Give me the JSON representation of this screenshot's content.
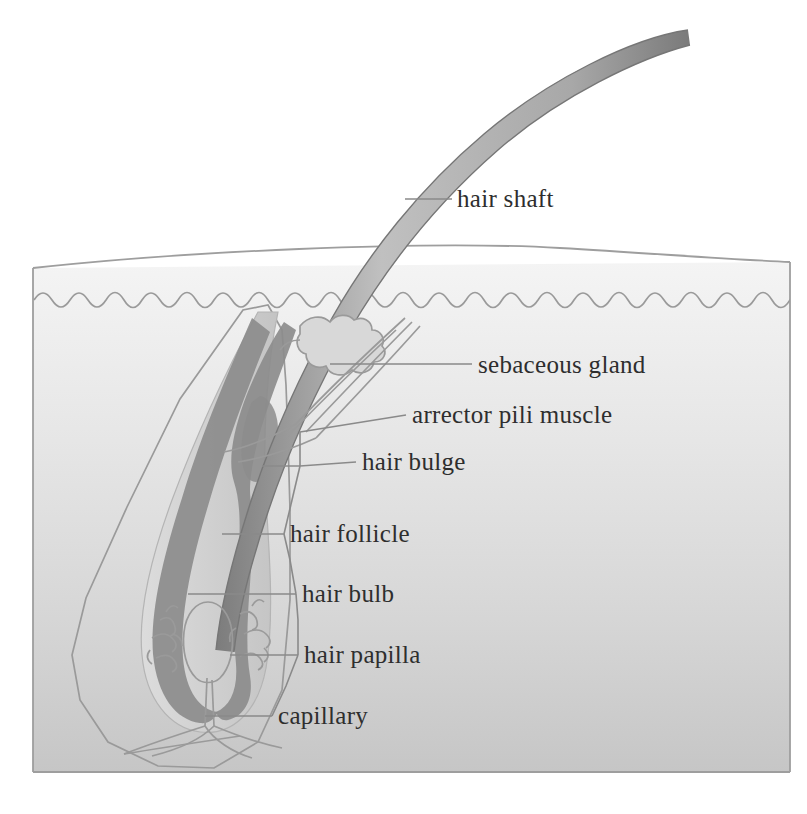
{
  "figure": {
    "type": "anatomical-diagram",
    "background_color": "#ffffff"
  },
  "colors": {
    "skin_top": "#f2f2f2",
    "skin_bottom": "#c9c9c9",
    "follicle_sheath": "#d3d3d3",
    "follicle_wall_dark": "#8f8f8f",
    "hair_shaft_fill": "#b9b9b9",
    "hair_shaft_edge": "#7e7e7e",
    "outline": "#9a9a9a",
    "leader_line": "#8a8a8a",
    "text": "#2e2e2e"
  },
  "labels": [
    {
      "id": "hair-shaft",
      "text": "hair shaft",
      "text_x": 457,
      "text_y": 207,
      "leader": "M 405 199 L 452 199"
    },
    {
      "id": "sebaceous-gland",
      "text": "sebaceous gland",
      "text_x": 478,
      "text_y": 373,
      "leader": "M 330 364 L 472 364"
    },
    {
      "id": "arrector-pili-muscle",
      "text": "arrector pili muscle",
      "text_x": 412,
      "text_y": 423,
      "leader": "M 360 415 L 406 415"
    },
    {
      "id": "hair-bulge",
      "text": "hair bulge",
      "text_x": 362,
      "text_y": 470,
      "leader": "M 288 462 L 356 462"
    },
    {
      "id": "hair-follicle",
      "text": "hair follicle",
      "text_x": 290,
      "text_y": 542,
      "leader": "M 222 534 L 284 534"
    },
    {
      "id": "hair-bulb",
      "text": "hair bulb",
      "text_x": 302,
      "text_y": 602,
      "leader": "M 188 594 L 296 594"
    },
    {
      "id": "hair-papilla",
      "text": "hair papilla",
      "text_x": 304,
      "text_y": 663,
      "leader": "M 230 655 L 298 655"
    },
    {
      "id": "capillary",
      "text": "capillary",
      "text_x": 278,
      "text_y": 724,
      "leader": "M 205 716 L 272 716"
    }
  ],
  "structures": {
    "skin_block_label": "skin block",
    "epidermis_label": "epidermis wavy boundary",
    "hair_shaft_label": "hair shaft",
    "sebaceous_gland_label": "sebaceous gland",
    "arrector_pili_label": "arrector pili muscle",
    "follicle_sheath_label": "follicle outer sheath",
    "follicle_wall_label": "hair follicle wall",
    "hair_bulb_label": "hair bulb",
    "hair_papilla_label": "hair papilla",
    "capillary_label": "capillary network"
  }
}
